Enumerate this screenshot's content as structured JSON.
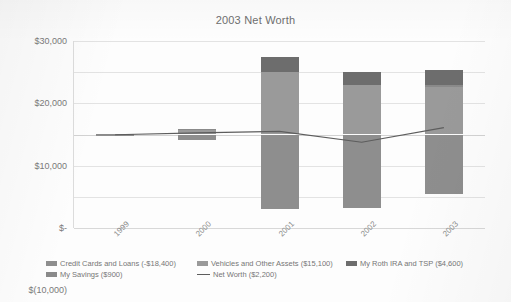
{
  "chart_data": {
    "type": "bar",
    "title": "2003 Net Worth",
    "xlabel": "",
    "ylabel": "",
    "categories": [
      "1999",
      "2000",
      "2001",
      "2002",
      "2003"
    ],
    "ylim": [
      -30000,
      30000
    ],
    "ytick_labels": [
      "$30,000",
      "$20,000",
      "$10,000",
      "$-",
      "$(10,000)",
      "$(20,000)",
      "$(30,000)"
    ],
    "ytick_values": [
      30000,
      20000,
      10000,
      0,
      -10000,
      -20000,
      -30000
    ],
    "grid": true,
    "legend_position": "bottom",
    "stacked": true,
    "series": [
      {
        "name": "Credit Cards and Loans (-$18,400)",
        "type": "bar",
        "color": "#8e8e8e",
        "values": [
          -300,
          -1700,
          -24000,
          -23500,
          -19000
        ]
      },
      {
        "name": "Vehicles and Other Assets ($15,100)",
        "type": "bar",
        "color": "#9a9a9a",
        "values": [
          200,
          1500,
          20000,
          16000,
          15100
        ]
      },
      {
        "name": "My Roth IRA and TSP ($4,600)",
        "type": "bar",
        "color": "#6d6d6d",
        "values": [
          0,
          0,
          5000,
          4000,
          4600
        ]
      },
      {
        "name": "My Savings ($900)",
        "type": "bar",
        "color": "#8a8a8a",
        "values": [
          100,
          200,
          0,
          0,
          900
        ]
      },
      {
        "name": "Net Worth ($2,200)",
        "type": "line",
        "color": "#5d5d5d",
        "values": [
          -100,
          500,
          1000,
          -2500,
          2200
        ]
      }
    ]
  },
  "legend": {
    "items": [
      {
        "label": "Credit Cards and Loans (-$18,400)",
        "marker": "swatch",
        "color": "#8e8e8e"
      },
      {
        "label": "Vehicles and Other Assets ($15,100)",
        "marker": "swatch",
        "color": "#9a9a9a"
      },
      {
        "label": "My Roth IRA and TSP ($4,600)",
        "marker": "swatch",
        "color": "#6d6d6d"
      },
      {
        "label": "My Savings ($900)",
        "marker": "swatch",
        "color": "#8a8a8a"
      },
      {
        "label": "Net Worth ($2,200)",
        "marker": "line",
        "color": "#5d5d5d"
      }
    ]
  }
}
